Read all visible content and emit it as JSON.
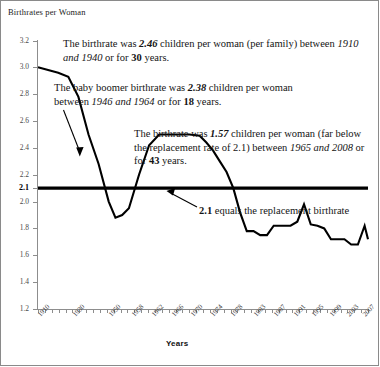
{
  "chart_title": "Birthrates per Woman",
  "x_axis_title": "Years",
  "annotations": {
    "a1_pre": "The birthrate was ",
    "a1_v": "2.46",
    "a1_mid": " children per woman (per family) between ",
    "a1_years": "1910 and 1940",
    "a1_mid2": " or for ",
    "a1_n": "30",
    "a1_end": " years.",
    "a2_pre": "The baby boomer birthrate was ",
    "a2_v": "2.38",
    "a2_mid": " children per woman between ",
    "a2_years": "1946 and 1964",
    "a2_mid2": " or for ",
    "a2_n": "18",
    "a2_end": " years.",
    "a3_pre": "The birthrate was ",
    "a3_v": "1.57",
    "a3_mid": " children per woman (far below the replacement rate of 2.1) between ",
    "a3_years": "1965 and 2008",
    "a3_mid2": " or for ",
    "a3_n": "43",
    "a3_end": " years.",
    "a4_v": "2.1",
    "a4_text": " equals the replacement birthrate"
  },
  "chart_data": {
    "type": "line",
    "title": "Birthrates per Woman",
    "xlabel": "Years",
    "ylabel": "",
    "ylim": [
      1.2,
      3.2
    ],
    "ytick_labels": [
      "3.2",
      "3.0",
      "2.8",
      "2.6",
      "2.4",
      "2.2",
      "2.1",
      "2.0",
      "1.8",
      "1.6",
      "1.4",
      "1.2"
    ],
    "ytick_values": [
      3.2,
      3.0,
      2.8,
      2.6,
      2.4,
      2.2,
      2.1,
      2.0,
      1.8,
      1.6,
      1.4,
      1.2
    ],
    "xtick_labels": [
      "1910",
      "1930",
      "1950",
      "1958",
      "1962",
      "1966",
      "1970",
      "1974",
      "1978",
      "1983",
      "1987",
      "1991",
      "1995",
      "1999",
      "2003",
      "2007"
    ],
    "grid": false,
    "legend": null,
    "reference_line": {
      "value": 2.1,
      "label": "2.1 equals the replacement birthrate"
    },
    "x": [
      1910,
      1913,
      1916,
      1919,
      1922,
      1925,
      1928,
      1931,
      1933,
      1935,
      1937,
      1940,
      1943,
      1946,
      1949,
      1952,
      1955,
      1958,
      1960,
      1962,
      1964,
      1966,
      1968,
      1970,
      1972,
      1974,
      1976,
      1978,
      1980,
      1983,
      1985,
      1987,
      1989,
      1991,
      1993,
      1995,
      1997,
      1999,
      2001,
      2003,
      2005,
      2007,
      2008
    ],
    "values": [
      3.0,
      2.98,
      2.96,
      2.93,
      2.78,
      2.5,
      2.28,
      2.0,
      1.88,
      1.9,
      1.95,
      2.2,
      2.42,
      2.5,
      2.5,
      2.5,
      2.5,
      2.49,
      2.44,
      2.38,
      2.3,
      2.22,
      2.1,
      1.92,
      1.78,
      1.78,
      1.75,
      1.75,
      1.82,
      1.82,
      1.82,
      1.85,
      1.98,
      1.83,
      1.82,
      1.8,
      1.72,
      1.72,
      1.72,
      1.68,
      1.68,
      1.82,
      1.72
    ],
    "series_color": "#000000",
    "notes": [
      "1910-1940 average birthrate 2.46 over 30 years",
      "1946-1964 baby boomer birthrate 2.38 over 18 years",
      "1965-2008 birthrate 1.57 over 43 years",
      "Replacement birthrate reference line at 2.1"
    ]
  }
}
